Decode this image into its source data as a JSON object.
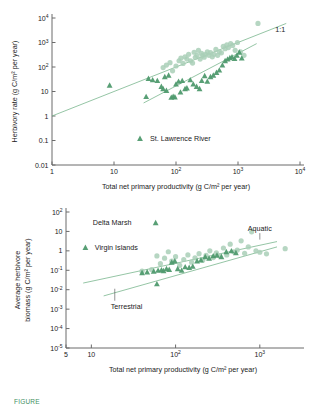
{
  "figure": {
    "caption_partial": "FIGURE",
    "marker_colors": {
      "aquatic_circle": "#a9cfb7",
      "terrestrial_triangle": "#4f9a6e",
      "line": "#7ab68e"
    }
  },
  "chart_data": [
    {
      "type": "scatter",
      "id": "herbivory-rate-vs-npp",
      "title": "",
      "xlabel": "Total net primary productivity  (g C/m² per year)",
      "ylabel": "Herbivory rate (g C/m² per year)",
      "xscale": "log",
      "yscale": "log",
      "xlim": [
        1,
        10000
      ],
      "ylim": [
        0.01,
        10000
      ],
      "xticks": [
        "1",
        "10",
        "10²",
        "10³",
        "10⁴"
      ],
      "xtick_values": [
        1,
        10,
        100,
        1000,
        10000
      ],
      "yticks": [
        "10⁴",
        "10³",
        "10²",
        "10",
        "1",
        "0.1",
        "0.01"
      ],
      "ytick_values": [
        10000,
        1000,
        100,
        10,
        1,
        0.1,
        0.01
      ],
      "grid": false,
      "annotations": [
        {
          "text": "1:1",
          "x": 4000,
          "y": 2600
        }
      ],
      "legend": [
        {
          "label": "St. Lawrence River",
          "marker": "triangle",
          "color": "#4f9a6e"
        }
      ],
      "legend_position": "inside-bottom-center",
      "lines": [
        {
          "name": "1:1 reference",
          "x": [
            1,
            6000
          ],
          "y": [
            1,
            6000
          ]
        },
        {
          "name": "terrestrial fit",
          "x": [
            30,
            2000
          ],
          "y": [
            3.4,
            900
          ]
        }
      ],
      "series": [
        {
          "name": "Aquatic",
          "marker": "circle",
          "color": "#a9cfb7",
          "points": [
            [
              62,
              95
            ],
            [
              70,
              120
            ],
            [
              80,
              150
            ],
            [
              88,
              70
            ],
            [
              100,
              110
            ],
            [
              112,
              180
            ],
            [
              120,
              230
            ],
            [
              130,
              140
            ],
            [
              140,
              260
            ],
            [
              150,
              210
            ],
            [
              160,
              330
            ],
            [
              172,
              180
            ],
            [
              185,
              145
            ],
            [
              196,
              400
            ],
            [
              205,
              250
            ],
            [
              218,
              300
            ],
            [
              230,
              480
            ],
            [
              245,
              210
            ],
            [
              258,
              360
            ],
            [
              270,
              300
            ],
            [
              285,
              250
            ],
            [
              300,
              330
            ],
            [
              320,
              420
            ],
            [
              340,
              300
            ],
            [
              360,
              390
            ],
            [
              385,
              260
            ],
            [
              410,
              330
            ],
            [
              440,
              520
            ],
            [
              470,
              300
            ],
            [
              500,
              420
            ],
            [
              540,
              380
            ],
            [
              580,
              700
            ],
            [
              620,
              560
            ],
            [
              660,
              800
            ],
            [
              700,
              620
            ],
            [
              760,
              900
            ],
            [
              820,
              760
            ],
            [
              900,
              480
            ],
            [
              980,
              1000
            ],
            [
              1100,
              420
            ],
            [
              1250,
              300
            ],
            [
              2100,
              6000
            ]
          ]
        },
        {
          "name": "St. Lawrence River",
          "marker": "triangle",
          "color": "#4f9a6e",
          "points": [
            [
              8.5,
              18
            ],
            [
              33,
              6.2
            ],
            [
              36,
              34
            ],
            [
              42,
              30
            ],
            [
              50,
              28
            ],
            [
              58,
              16
            ],
            [
              62,
              13
            ],
            [
              66,
              40
            ],
            [
              70,
              11
            ],
            [
              76,
              46
            ],
            [
              84,
              5.8
            ],
            [
              90,
              6.3
            ],
            [
              96,
              6.0
            ],
            [
              100,
              20
            ],
            [
              110,
              26
            ],
            [
              118,
              9.5
            ],
            [
              126,
              28
            ],
            [
              140,
              13
            ],
            [
              150,
              14
            ],
            [
              170,
              30
            ],
            [
              190,
              20
            ],
            [
              215,
              16
            ],
            [
              240,
              13
            ],
            [
              260,
              28
            ],
            [
              290,
              44
            ],
            [
              320,
              26
            ],
            [
              360,
              40
            ],
            [
              400,
              46
            ],
            [
              450,
              60
            ],
            [
              500,
              75
            ],
            [
              560,
              120
            ],
            [
              620,
              180
            ],
            [
              680,
              210
            ],
            [
              740,
              240
            ],
            [
              800,
              260
            ],
            [
              880,
              220
            ],
            [
              960,
              300
            ],
            [
              1050,
              400
            ],
            [
              1150,
              230
            ]
          ]
        }
      ]
    },
    {
      "type": "scatter",
      "id": "herbivore-biomass-vs-npp",
      "title": "",
      "xlabel": "Total net primary productivity  (g C/m² per year)",
      "ylabel": "Average herbivore biomass (g C/m² per year)",
      "ylabel_line1": "Average herbivore",
      "ylabel_line2": "biomass (g C/m² per year)",
      "xscale": "log",
      "yscale": "log",
      "xlim": [
        5,
        3000
      ],
      "ylim": [
        1e-05,
        100
      ],
      "xticks": [
        "5",
        "10",
        "10²",
        "10³"
      ],
      "xtick_values": [
        5,
        10,
        100,
        1000
      ],
      "yticks": [
        "10²",
        "10",
        "1",
        "10⁻¹",
        "10⁻²",
        "10⁻³",
        "10⁻⁴",
        "10⁻⁵"
      ],
      "ytick_values": [
        100,
        10,
        1,
        0.1,
        0.01,
        0.001,
        0.0001,
        1e-05
      ],
      "grid": false,
      "annotations": [
        {
          "text": "Delta Marsh",
          "x": 30,
          "y": 28,
          "marker": "triangle"
        },
        {
          "text": "Virgin Islands",
          "x": 11,
          "y": 1.5,
          "marker": "triangle"
        },
        {
          "text": "Aquatic",
          "x": 1000,
          "y": 11,
          "leader": "down"
        },
        {
          "text": "Terrestrial",
          "x": 17,
          "y": 0.0015,
          "leader": "up"
        }
      ],
      "lines": [
        {
          "name": "Aquatic fit",
          "x": [
            8,
            1600
          ],
          "y": [
            0.022,
            3.0
          ]
        },
        {
          "name": "Terrestrial fit",
          "x": [
            14,
            1600
          ],
          "y": [
            0.0048,
            1.6
          ]
        }
      ],
      "series": [
        {
          "name": "Aquatic",
          "marker": "circle",
          "color": "#a9cfb7",
          "points": [
            [
              40,
              0.09
            ],
            [
              52,
              0.11
            ],
            [
              60,
              0.55
            ],
            [
              66,
              0.22
            ],
            [
              74,
              0.42
            ],
            [
              82,
              0.9
            ],
            [
              90,
              0.3
            ],
            [
              100,
              0.5
            ],
            [
              112,
              0.18
            ],
            [
              125,
              0.36
            ],
            [
              140,
              0.62
            ],
            [
              155,
              0.26
            ],
            [
              170,
              0.44
            ],
            [
              190,
              0.72
            ],
            [
              210,
              0.33
            ],
            [
              230,
              0.58
            ],
            [
              255,
              1.0
            ],
            [
              280,
              0.45
            ],
            [
              305,
              0.8
            ],
            [
              335,
              0.55
            ],
            [
              370,
              1.4
            ],
            [
              405,
              0.62
            ],
            [
              445,
              2.2
            ],
            [
              490,
              0.9
            ],
            [
              540,
              1.1
            ],
            [
              600,
              3.3
            ],
            [
              660,
              0.75
            ],
            [
              730,
              1.6
            ],
            [
              800,
              9.5
            ],
            [
              900,
              1.0
            ],
            [
              1000,
              0.85
            ],
            [
              1200,
              0.7
            ],
            [
              2000,
              1.3
            ]
          ]
        },
        {
          "name": "Terrestrial",
          "marker": "triangle",
          "color": "#4f9a6e",
          "points": [
            [
              8.5,
              1.5
            ],
            [
              40,
              0.075
            ],
            [
              46,
              0.082
            ],
            [
              55,
              0.09
            ],
            [
              60,
              0.02
            ],
            [
              62,
              0.1
            ],
            [
              68,
              0.105
            ],
            [
              72,
              0.095
            ],
            [
              78,
              0.12
            ],
            [
              84,
              0.11
            ],
            [
              90,
              0.26
            ],
            [
              98,
              0.3
            ],
            [
              106,
              0.12
            ],
            [
              118,
              0.1
            ],
            [
              130,
              0.15
            ],
            [
              145,
              0.14
            ],
            [
              160,
              0.16
            ],
            [
              180,
              0.3
            ],
            [
              200,
              0.34
            ],
            [
              225,
              0.5
            ],
            [
              250,
              0.42
            ],
            [
              280,
              0.55
            ],
            [
              310,
              0.6
            ],
            [
              350,
              0.5
            ],
            [
              400,
              0.9
            ],
            [
              460,
              1.0
            ],
            [
              520,
              0.8
            ],
            [
              58,
              28
            ]
          ]
        }
      ]
    }
  ]
}
